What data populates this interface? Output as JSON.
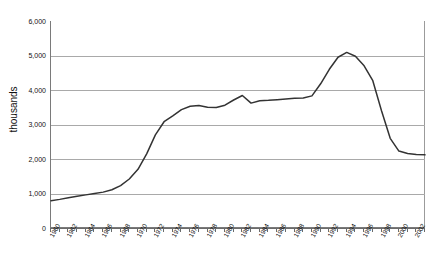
{
  "chart_data": {
    "type": "line",
    "title": "",
    "title_fragment": "",
    "xlabel": "",
    "ylabel": "thousands",
    "ylim": [
      0,
      6000
    ],
    "ytick_values": [
      0,
      1000,
      2000,
      3000,
      4000,
      5000,
      6000
    ],
    "ytick_labels": [
      "0",
      "1,000",
      "2,000",
      "3,000",
      "4,000",
      "5,000",
      "6,000"
    ],
    "xlim": [
      1960,
      2003
    ],
    "grid": true,
    "legend": "none",
    "xtick_labels": [
      "1960",
      "1962",
      "1964",
      "1966",
      "1968",
      "1970",
      "1972",
      "1974",
      "1976",
      "1978",
      "1980",
      "1982",
      "1984",
      "1986",
      "1988",
      "1990",
      "1992",
      "1994",
      "1996",
      "1998",
      "2000",
      "2002"
    ],
    "line_color": "#333333",
    "series": [
      {
        "name": "value",
        "x": [
          1960,
          1961,
          1962,
          1963,
          1964,
          1965,
          1966,
          1967,
          1968,
          1969,
          1970,
          1971,
          1972,
          1973,
          1974,
          1975,
          1976,
          1977,
          1978,
          1979,
          1980,
          1981,
          1982,
          1983,
          1984,
          1985,
          1986,
          1987,
          1988,
          1989,
          1990,
          1991,
          1992,
          1993,
          1994,
          1995,
          1996,
          1997,
          1998,
          1999,
          2000,
          2001,
          2002,
          2003
        ],
        "values": [
          790,
          830,
          880,
          920,
          960,
          1000,
          1040,
          1110,
          1230,
          1420,
          1700,
          2150,
          2700,
          3080,
          3250,
          3430,
          3530,
          3550,
          3500,
          3490,
          3560,
          3710,
          3840,
          3620,
          3690,
          3700,
          3720,
          3740,
          3760,
          3770,
          3830,
          4180,
          4600,
          4950,
          5090,
          4980,
          4700,
          4270,
          3400,
          2600,
          2230,
          2160,
          2130,
          2120
        ]
      }
    ]
  }
}
